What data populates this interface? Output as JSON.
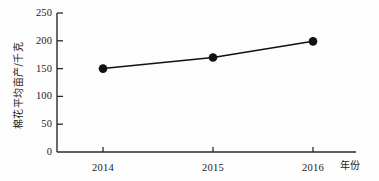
{
  "chart_data": {
    "type": "line",
    "title": "",
    "subtitle": "",
    "categories": [
      "2014",
      "2015",
      "2016"
    ],
    "x": [
      2014,
      2015,
      2016
    ],
    "values": [
      150,
      170,
      199
    ],
    "series": [
      {
        "name": "棉花平均亩产",
        "values": [
          150,
          170,
          199
        ]
      }
    ],
    "xlabel": "年份",
    "ylabel": "棉花平均亩产/千克",
    "ylim": [
      0,
      250
    ],
    "yticks": [
      "0",
      "50",
      "100",
      "150",
      "200",
      "250"
    ],
    "ytick_values": [
      0,
      50,
      100,
      150,
      200,
      250
    ],
    "xticks": [
      "2014",
      "2015",
      "2016"
    ],
    "grid": false,
    "legend": false,
    "legend_position": "none",
    "marker": "filled-circle",
    "line_color": "#111111",
    "marker_color": "#111111",
    "axis_color": "#2a2a2a",
    "background_color": "#fdfdfd",
    "annotations": []
  }
}
